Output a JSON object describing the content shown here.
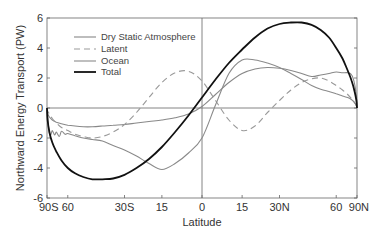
{
  "chart_data": {
    "type": "line",
    "title": "",
    "xlabel": "Latitude",
    "ylabel": "Northward Energy Transport (PW)",
    "x_scale": "sine of latitude",
    "xlim": [
      -90,
      90
    ],
    "ylim": [
      -6,
      6
    ],
    "grid": false,
    "zero_line": true,
    "equator_line": true,
    "legend_position": "upper left",
    "x_ticks": [
      {
        "value": -90,
        "label": "90S"
      },
      {
        "value": -60,
        "label": "60"
      },
      {
        "value": -30,
        "label": "30S"
      },
      {
        "value": -15,
        "label": "15"
      },
      {
        "value": 0,
        "label": "0"
      },
      {
        "value": 15,
        "label": "15"
      },
      {
        "value": 30,
        "label": "30N"
      },
      {
        "value": 60,
        "label": "60"
      },
      {
        "value": 90,
        "label": "90N"
      }
    ],
    "y_ticks": [
      {
        "value": 6,
        "label": "6"
      },
      {
        "value": 4,
        "label": "4"
      },
      {
        "value": 2,
        "label": "2"
      },
      {
        "value": 0,
        "label": "0"
      },
      {
        "value": -2,
        "label": "-2"
      },
      {
        "value": -4,
        "label": "-4"
      },
      {
        "value": -6,
        "label": "-6"
      }
    ],
    "series": [
      {
        "name": "Dry Static Atmosphere",
        "color": "#888888",
        "width": 1.1,
        "dash": "",
        "x": [
          -90,
          -85,
          -80,
          -75,
          -70,
          -65,
          -60,
          -55,
          -50,
          -45,
          -40,
          -35,
          -30,
          -25,
          -20,
          -15,
          -10,
          -5,
          0,
          5,
          10,
          15,
          20,
          25,
          30,
          35,
          40,
          45,
          50,
          55,
          60,
          65,
          70,
          75,
          80,
          85,
          90
        ],
        "values": [
          0,
          -0.35,
          -0.6,
          -0.8,
          -0.95,
          -1.05,
          -1.15,
          -1.2,
          -1.25,
          -1.25,
          -1.2,
          -1.15,
          -1.1,
          -1.0,
          -0.9,
          -0.8,
          -0.65,
          -0.4,
          0.1,
          0.9,
          1.7,
          2.3,
          2.6,
          2.7,
          2.65,
          2.5,
          2.3,
          2.1,
          2.2,
          2.3,
          2.4,
          2.35,
          2.35,
          2.2,
          1.6,
          0.8,
          0
        ]
      },
      {
        "name": "Latent",
        "color": "#999999",
        "width": 1.1,
        "dash": "6,4",
        "x": [
          -90,
          -85,
          -80,
          -75,
          -70,
          -65,
          -60,
          -55,
          -50,
          -45,
          -40,
          -35,
          -30,
          -25,
          -20,
          -15,
          -10,
          -5,
          0,
          5,
          10,
          15,
          20,
          25,
          30,
          35,
          40,
          45,
          50,
          55,
          60,
          65,
          70,
          75,
          80,
          85,
          90
        ],
        "values": [
          0,
          -0.2,
          -0.4,
          -0.7,
          -1.0,
          -1.3,
          -1.5,
          -1.75,
          -1.9,
          -2.0,
          -1.9,
          -1.6,
          -1.1,
          -0.3,
          0.7,
          1.7,
          2.35,
          2.45,
          1.8,
          0.5,
          -0.8,
          -1.5,
          -1.2,
          -0.3,
          0.5,
          1.2,
          1.7,
          1.95,
          2.0,
          1.8,
          1.5,
          1.2,
          0.9,
          0.6,
          0.35,
          0.15,
          0
        ]
      },
      {
        "name": "Ocean",
        "color": "#8a8a8a",
        "width": 1.1,
        "dash": "",
        "x": [
          -90,
          -85,
          -80,
          -77,
          -75,
          -72,
          -70,
          -67,
          -65,
          -62,
          -60,
          -55,
          -50,
          -45,
          -40,
          -35,
          -30,
          -25,
          -20,
          -15,
          -10,
          -5,
          0,
          5,
          10,
          15,
          20,
          25,
          30,
          35,
          40,
          45,
          50,
          55,
          60,
          65,
          70,
          75,
          80,
          85,
          90
        ],
        "values": [
          0,
          -0.6,
          -1.7,
          -1.75,
          -1.5,
          -1.8,
          -1.6,
          -1.9,
          -1.55,
          -1.75,
          -1.7,
          -1.85,
          -2.0,
          -2.1,
          -2.2,
          -2.5,
          -2.8,
          -3.2,
          -3.7,
          -4.1,
          -3.7,
          -3.0,
          -2.0,
          0.2,
          2.3,
          3.2,
          3.2,
          3.0,
          2.7,
          2.3,
          1.9,
          1.5,
          1.25,
          1.1,
          0.95,
          0.8,
          0.7,
          0.55,
          0.35,
          0.15,
          0
        ]
      },
      {
        "name": "Total",
        "color": "#111111",
        "width": 1.8,
        "dash": "",
        "x": [
          -90,
          -85,
          -80,
          -75,
          -70,
          -65,
          -60,
          -55,
          -50,
          -45,
          -40,
          -35,
          -30,
          -25,
          -20,
          -15,
          -10,
          -5,
          0,
          5,
          10,
          15,
          20,
          25,
          30,
          35,
          40,
          45,
          50,
          55,
          60,
          65,
          70,
          75,
          80,
          85,
          90
        ],
        "values": [
          0,
          -0.8,
          -1.6,
          -2.3,
          -2.9,
          -3.5,
          -4.0,
          -4.35,
          -4.6,
          -4.75,
          -4.75,
          -4.7,
          -4.45,
          -4.0,
          -3.4,
          -2.6,
          -1.6,
          -0.5,
          0.7,
          1.9,
          3.0,
          3.9,
          4.7,
          5.3,
          5.6,
          5.7,
          5.7,
          5.55,
          5.2,
          4.7,
          4.0,
          3.3,
          2.5,
          1.8,
          1.1,
          0.5,
          0
        ]
      }
    ]
  },
  "legend": {
    "items": [
      {
        "label": "Dry Static Atmosphere"
      },
      {
        "label": "Latent"
      },
      {
        "label": "Ocean"
      },
      {
        "label": "Total"
      }
    ]
  },
  "axes": {
    "xlabel": "Latitude",
    "ylabel": "Northward Energy Transport (PW)"
  }
}
